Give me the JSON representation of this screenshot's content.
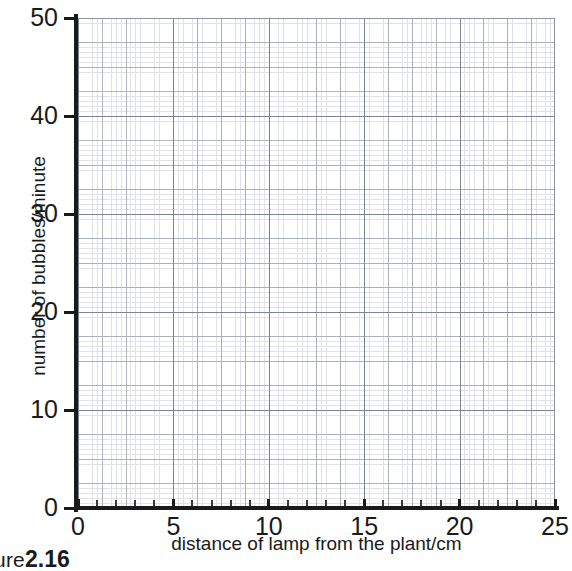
{
  "chart_data": {
    "type": "scatter",
    "title": "",
    "subtitle": "",
    "xlabel": "distance of lamp from the plant/cm",
    "ylabel": "number of bubbles/minute",
    "xlim": [
      0,
      25
    ],
    "ylim": [
      0,
      50
    ],
    "x_tick_labels": [
      "0",
      "5",
      "10",
      "15",
      "20",
      "25"
    ],
    "x_ticks": [
      0,
      5,
      10,
      15,
      20,
      25
    ],
    "x_minor_tick_interval": 1,
    "y_tick_labels": [
      "0",
      "10",
      "20",
      "30",
      "40",
      "50"
    ],
    "y_ticks": [
      0,
      10,
      20,
      30,
      40,
      50
    ],
    "grid": true,
    "grid_style": "millimetre graph paper",
    "legend": "none",
    "series": [
      {
        "name": "",
        "x": [],
        "y": []
      }
    ],
    "annotations": [],
    "note": "blank graph-paper axes; no data points plotted"
  },
  "axes": {
    "x": {
      "title": "distance of lamp from the plant/cm",
      "ticks": [
        {
          "value": 0,
          "label": "0"
        },
        {
          "value": 5,
          "label": "5"
        },
        {
          "value": 10,
          "label": "10"
        },
        {
          "value": 15,
          "label": "15"
        },
        {
          "value": 20,
          "label": "20"
        },
        {
          "value": 25,
          "label": "25"
        }
      ]
    },
    "y": {
      "title": "number of bubbles/minute",
      "ticks": [
        {
          "value": 0,
          "label": "0"
        },
        {
          "value": 10,
          "label": "10"
        },
        {
          "value": 20,
          "label": "20"
        },
        {
          "value": 30,
          "label": "30"
        },
        {
          "value": 40,
          "label": "40"
        },
        {
          "value": 50,
          "label": "50"
        }
      ]
    }
  },
  "caption": {
    "word": "ure",
    "number": "2.16"
  },
  "colors": {
    "axis": "#1a1a1a",
    "grid_fine": "#c9ccd4",
    "grid_mid": "#9aa0ac",
    "grid_major": "#7b8190",
    "background": "#ffffff",
    "text": "#1a1a1a"
  }
}
